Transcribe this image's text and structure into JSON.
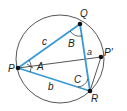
{
  "diagram": {
    "colors": {
      "triangle": "#3a9ad9",
      "circle": "#2a2a2a",
      "line": "#2a2a2a",
      "point": "#111111",
      "background": "#ffffff"
    },
    "circle": {
      "cx": 60,
      "cy": 59,
      "r": 44
    },
    "points": {
      "P": {
        "label": "P",
        "x": 18,
        "y": 68
      },
      "Q": {
        "label": "Q",
        "x": 80,
        "y": 24
      },
      "R": {
        "label": "R",
        "x": 90,
        "y": 91
      },
      "P_prime": {
        "label": "P'",
        "x": 101,
        "y": 57
      }
    },
    "sides": {
      "a": "a",
      "b": "b",
      "c": "c"
    },
    "angles": {
      "A": "A",
      "B": "B",
      "C": "C"
    }
  }
}
